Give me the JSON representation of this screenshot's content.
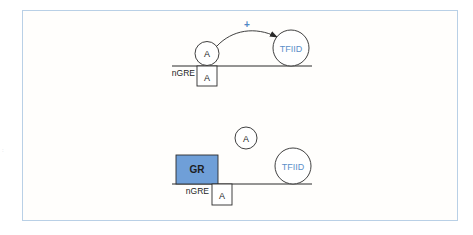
{
  "colors": {
    "panel_border": "#b9d0e6",
    "gr_fill": "#6f9fd8",
    "gr_stroke": "#2c2c2c",
    "tfiid_text": "#5b8fc9",
    "plus_sign": "#4f87c5",
    "line": "#2a2a2a",
    "text": "#1e1e1e"
  },
  "top_state": {
    "activator_label": "A",
    "element_label": "nGRE",
    "element_box_label": "A",
    "tfiid_label": "TFIID",
    "effect_sign": "+"
  },
  "bottom_state": {
    "receptor_label": "GR",
    "element_label": "nGRE",
    "element_box_label": "A",
    "displaced_activator_label": "A",
    "tfiid_label": "TFIID"
  }
}
